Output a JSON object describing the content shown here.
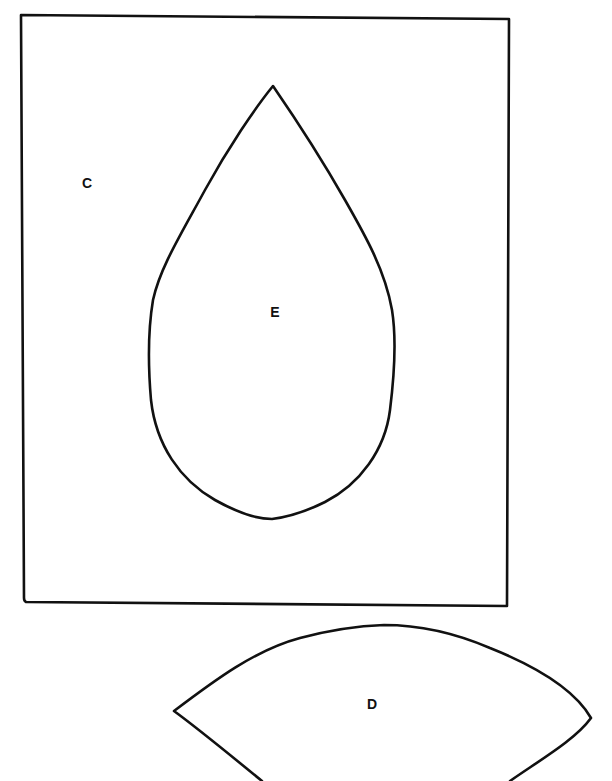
{
  "diagram": {
    "colors": {
      "stroke": "#111111",
      "background": "#ffffff"
    },
    "pieces": [
      {
        "id": "C",
        "label": "C",
        "shape": "rectangle",
        "label_pos": [
          87,
          183
        ]
      },
      {
        "id": "E",
        "label": "E",
        "shape": "teardrop",
        "label_pos": [
          275,
          312
        ]
      },
      {
        "id": "D",
        "label": "D",
        "shape": "lens",
        "label_pos": [
          372,
          704
        ]
      }
    ]
  }
}
